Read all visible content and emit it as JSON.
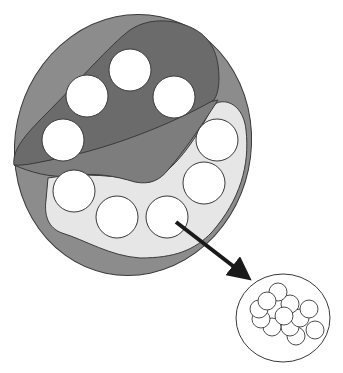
{
  "diagram": {
    "colors": {
      "background": "#ffffff",
      "outer_ellipse": "#8c8c8c",
      "dark_region": "#6b6b6b",
      "mid_region": "#7d7d7d",
      "light_region": "#e6e6e6",
      "vesicle_fill": "#ffffff",
      "stroke": "#3a3a3a",
      "arrow": "#1a1a1a"
    },
    "outer_ellipse": {
      "cx": 133,
      "cy": 145,
      "rx": 118,
      "ry": 131,
      "rotate": 12
    },
    "dark_region_vesicles": [
      {
        "cx": 130,
        "cy": 70,
        "r": 21
      },
      {
        "cx": 87,
        "cy": 96,
        "r": 21
      },
      {
        "cx": 174,
        "cy": 97,
        "r": 21
      },
      {
        "cx": 63,
        "cy": 140,
        "r": 21
      }
    ],
    "light_region_vesicles": [
      {
        "cx": 217,
        "cy": 140,
        "r": 21
      },
      {
        "cx": 204,
        "cy": 183,
        "r": 21
      },
      {
        "cx": 74,
        "cy": 191,
        "r": 21
      },
      {
        "cx": 117,
        "cy": 217,
        "r": 21
      },
      {
        "cx": 167,
        "cy": 217,
        "r": 21
      }
    ],
    "arrow": {
      "x1": 176,
      "y1": 222,
      "x2": 253,
      "y2": 282
    },
    "magnified_view": {
      "cx": 283,
      "cy": 318,
      "rx": 47,
      "ry": 44,
      "spheres": [
        {
          "cx": 278,
          "cy": 292,
          "r": 9
        },
        {
          "cx": 267,
          "cy": 301,
          "r": 9
        },
        {
          "cx": 290,
          "cy": 304,
          "r": 9
        },
        {
          "cx": 309,
          "cy": 309,
          "r": 9
        },
        {
          "cx": 259,
          "cy": 309,
          "r": 9
        },
        {
          "cx": 261,
          "cy": 319,
          "r": 9
        },
        {
          "cx": 300,
          "cy": 318,
          "r": 9
        },
        {
          "cx": 272,
          "cy": 327,
          "r": 9
        },
        {
          "cx": 290,
          "cy": 327,
          "r": 9
        },
        {
          "cx": 284,
          "cy": 316,
          "r": 9
        },
        {
          "cx": 296,
          "cy": 336,
          "r": 9
        },
        {
          "cx": 315,
          "cy": 330,
          "r": 9
        }
      ]
    }
  }
}
